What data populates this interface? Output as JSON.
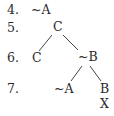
{
  "diagram": {
    "type": "truth-tree",
    "lines": [
      {
        "number": "4.",
        "nodes": [
          "~A"
        ]
      },
      {
        "number": "5.",
        "nodes": [
          "C"
        ]
      },
      {
        "number": "6.",
        "nodes": [
          "C",
          "~B"
        ]
      },
      {
        "number": "7.",
        "nodes": [
          "~A",
          "B"
        ]
      }
    ],
    "closure_mark": "X",
    "edges": [
      {
        "from": "C (line 5)",
        "to": "C (line 6)"
      },
      {
        "from": "C (line 5)",
        "to": "~B (line 6)"
      },
      {
        "from": "~B (line 6)",
        "to": "~A (line 7)"
      },
      {
        "from": "~B (line 6)",
        "to": "B (line 7)"
      }
    ]
  },
  "labels": {
    "n4": "4.",
    "n5": "5.",
    "n6": "6.",
    "n7": "7.",
    "l4_a": "~A",
    "l5_c": "C",
    "l6_c": "C",
    "l6_nb": "~B",
    "l7_na": "~A",
    "l7_b": "B",
    "x_mark": "X"
  }
}
